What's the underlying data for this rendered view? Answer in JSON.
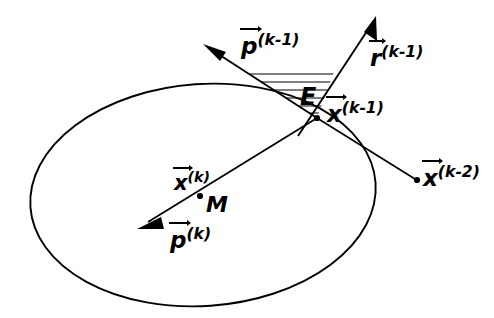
{
  "figure": {
    "kind": "geometric-vector-diagram",
    "background_color": "#ffffff",
    "stroke_color": "#000000",
    "width": 494,
    "height": 318
  },
  "labels": {
    "p_prev": {
      "base": "p",
      "superscript": "(k-1)",
      "text": "p(k-1)"
    },
    "r_prev": {
      "base": "r",
      "superscript": "(k-1)",
      "text": "r(k-1)"
    },
    "error_region": {
      "text": "E"
    },
    "x_prev": {
      "base": "x",
      "superscript": "(k-1)",
      "text": "x(k-1)"
    },
    "x_prev2": {
      "base": "x",
      "superscript": "(k-2)",
      "text": "x(k-2)"
    },
    "x_cur": {
      "base": "x",
      "superscript": "(k)",
      "text": "x(k)"
    },
    "minimum": {
      "text": "M"
    },
    "p_cur": {
      "base": "p",
      "superscript": "(k)",
      "text": "p(k)"
    }
  },
  "geometry": {
    "ellipse": {
      "cx": 203,
      "cy": 195,
      "rx": 173,
      "ry": 111,
      "rotation_deg": -4
    },
    "points": {
      "x_prev": {
        "x": 317,
        "y": 118
      },
      "x_prev2": {
        "x": 417,
        "y": 180
      },
      "x_cur": {
        "x": 200,
        "y": 196
      }
    },
    "vectors": {
      "p_prev": {
        "from_x": 317,
        "from_y": 118,
        "to_x": 205,
        "to_y": 45
      },
      "r_prev": {
        "from_x": 300,
        "from_y": 133,
        "to_x": 376,
        "to_y": 18
      },
      "p_cur": {
        "from_x": 317,
        "from_y": 118,
        "to_x": 138,
        "to_y": 228
      }
    },
    "hatch_lines": 6
  }
}
